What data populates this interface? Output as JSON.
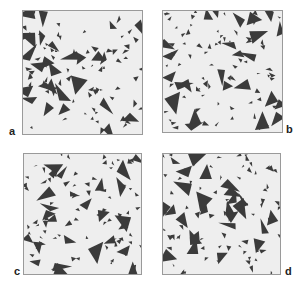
{
  "figure": {
    "background": "#ffffff",
    "panel_fill": "#eeeeee",
    "panel_border": "#9a9a9a",
    "triangle_color": "#3b3b3b",
    "panels": [
      {
        "id": "a",
        "label": "a",
        "x": 22,
        "y": 10,
        "w": 121,
        "h": 125,
        "label_x": 9,
        "label_y": 126,
        "seed": 11
      },
      {
        "id": "b",
        "label": "b",
        "x": 162,
        "y": 10,
        "w": 121,
        "h": 123,
        "label_x": 286,
        "label_y": 124,
        "seed": 29
      },
      {
        "id": "c",
        "label": "c",
        "x": 23,
        "y": 153,
        "w": 119,
        "h": 122,
        "label_x": 14,
        "label_y": 266,
        "seed": 47
      },
      {
        "id": "d",
        "label": "d",
        "x": 162,
        "y": 153,
        "w": 119,
        "h": 122,
        "label_x": 285,
        "label_y": 266,
        "seed": 83
      }
    ],
    "triangles_per_panel": {
      "large": 26,
      "small": 70
    }
  }
}
